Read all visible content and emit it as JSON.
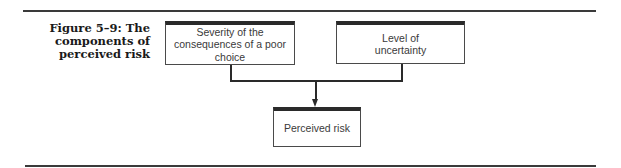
{
  "figure": {
    "caption": "Figure 5–9: The components of perceived risk"
  },
  "diagram": {
    "nodes": [
      {
        "id": "severity",
        "label": "Severity of the consequences of a poor choice"
      },
      {
        "id": "uncertainty",
        "label": "Level of uncertainty"
      },
      {
        "id": "perceived_risk",
        "label": "Perceived risk"
      }
    ],
    "edges": [
      {
        "from": "severity",
        "to": "perceived_risk"
      },
      {
        "from": "uncertainty",
        "to": "perceived_risk"
      }
    ]
  }
}
